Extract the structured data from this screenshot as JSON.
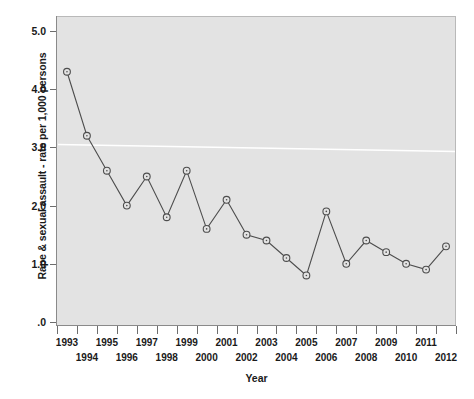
{
  "chart_data": {
    "type": "line",
    "title": "",
    "xlabel": "Year",
    "ylabel": "Rape & sexual assault - rate per 1,000 persons",
    "categories": [
      "1993",
      "1994",
      "1995",
      "1996",
      "1997",
      "1998",
      "1999",
      "2000",
      "2001",
      "2002",
      "2003",
      "2004",
      "2005",
      "2006",
      "2007",
      "2008",
      "2009",
      "2010",
      "2011",
      "2012"
    ],
    "values": [
      4.3,
      3.2,
      2.6,
      2.0,
      2.5,
      1.8,
      2.6,
      1.6,
      2.1,
      1.5,
      1.4,
      1.1,
      0.8,
      1.9,
      1.0,
      1.4,
      1.2,
      1.0,
      0.9,
      1.3
    ],
    "series": [
      {
        "name": "Rape & sexual assault rate",
        "values": [
          4.3,
          3.2,
          2.6,
          2.0,
          2.5,
          1.8,
          2.6,
          1.6,
          2.1,
          1.5,
          1.4,
          1.1,
          0.8,
          1.9,
          1.0,
          1.4,
          1.2,
          1.0,
          0.9,
          1.3
        ]
      }
    ],
    "ylim": [
      0,
      5.0
    ],
    "yticks": [
      5.0,
      4.0,
      3.0,
      2.0,
      1.0,
      0.0
    ],
    "ytick_labels": [
      "5.0",
      "4.0",
      "3.0",
      "2.0",
      "1.0",
      ".0"
    ],
    "grid": false,
    "legend": "none",
    "marker": "circle-open",
    "line_color": "#4d4d4d",
    "marker_color": "#4d4d4d",
    "plot_background": "#e3e3e3",
    "page_background": "#ffffff",
    "reference_line": {
      "label": "",
      "color": "#ffffff",
      "y_start": 3.05,
      "y_end": 2.93
    },
    "xtick_rows": {
      "top": [
        "1993",
        "1995",
        "1997",
        "1999",
        "2001",
        "2003",
        "2005",
        "2007",
        "2009",
        "2011"
      ],
      "bottom": [
        "1994",
        "1996",
        "1998",
        "2000",
        "2002",
        "2004",
        "2006",
        "2008",
        "2010",
        "2012"
      ]
    }
  }
}
